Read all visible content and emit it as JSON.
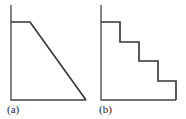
{
  "panels": [
    {
      "label": "(a)",
      "shape": "plateau-then-linear-decline"
    },
    {
      "label": "(b)",
      "shape": "plateau-then-staircase-decline"
    }
  ],
  "colors": {
    "line": "#333333",
    "background": "#ffffff"
  }
}
